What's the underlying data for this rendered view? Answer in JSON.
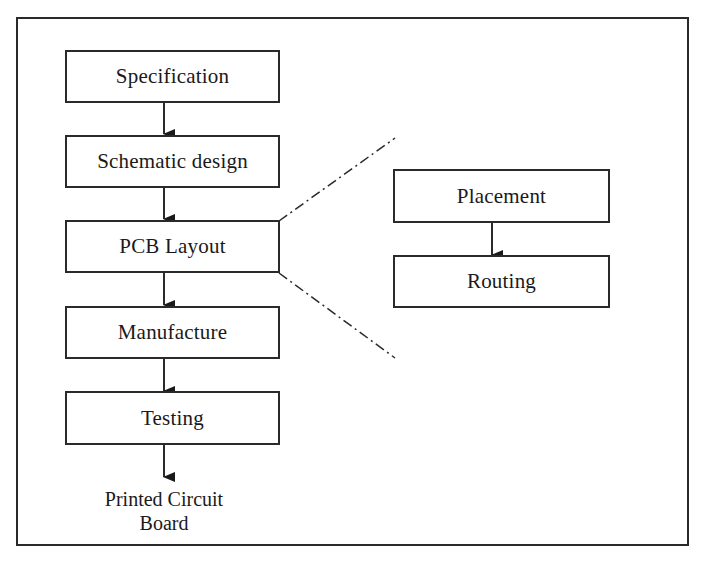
{
  "diagram": {
    "main_flow": [
      {
        "id": "spec",
        "label": "Specification"
      },
      {
        "id": "schematic",
        "label": "Schematic design"
      },
      {
        "id": "layout",
        "label": "PCB Layout"
      },
      {
        "id": "manufacture",
        "label": "Manufacture"
      },
      {
        "id": "testing",
        "label": "Testing"
      }
    ],
    "output": {
      "line1": "Printed Circuit",
      "line2": "Board"
    },
    "layout_detail": [
      {
        "id": "placement",
        "label": "Placement"
      },
      {
        "id": "routing",
        "label": "Routing"
      }
    ],
    "colors": {
      "stroke": "#2a2a2a",
      "background": "#ffffff"
    }
  }
}
